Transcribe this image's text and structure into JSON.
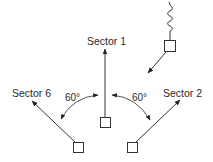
{
  "diagram": {
    "type": "sector-antenna-directions",
    "labels": {
      "sector1": "Sector 1",
      "sector2": "Sector 2",
      "sector6": "Sector 6",
      "angle_left": "60°",
      "angle_right": "60°"
    },
    "colors": {
      "line": "#333333",
      "text": "#2a2a2a",
      "background": "#ffffff"
    },
    "elements": [
      {
        "id": "incoming-source",
        "kind": "box-with-coil",
        "note": "signal source with coiled antenna, arrow pointing down-left"
      },
      {
        "id": "center-antenna",
        "kind": "box",
        "arrow_to": "Sector 1"
      },
      {
        "id": "left-antenna",
        "kind": "box",
        "arrow_to": "Sector 6"
      },
      {
        "id": "right-antenna",
        "kind": "box",
        "arrow_to": "Sector 2"
      }
    ]
  }
}
